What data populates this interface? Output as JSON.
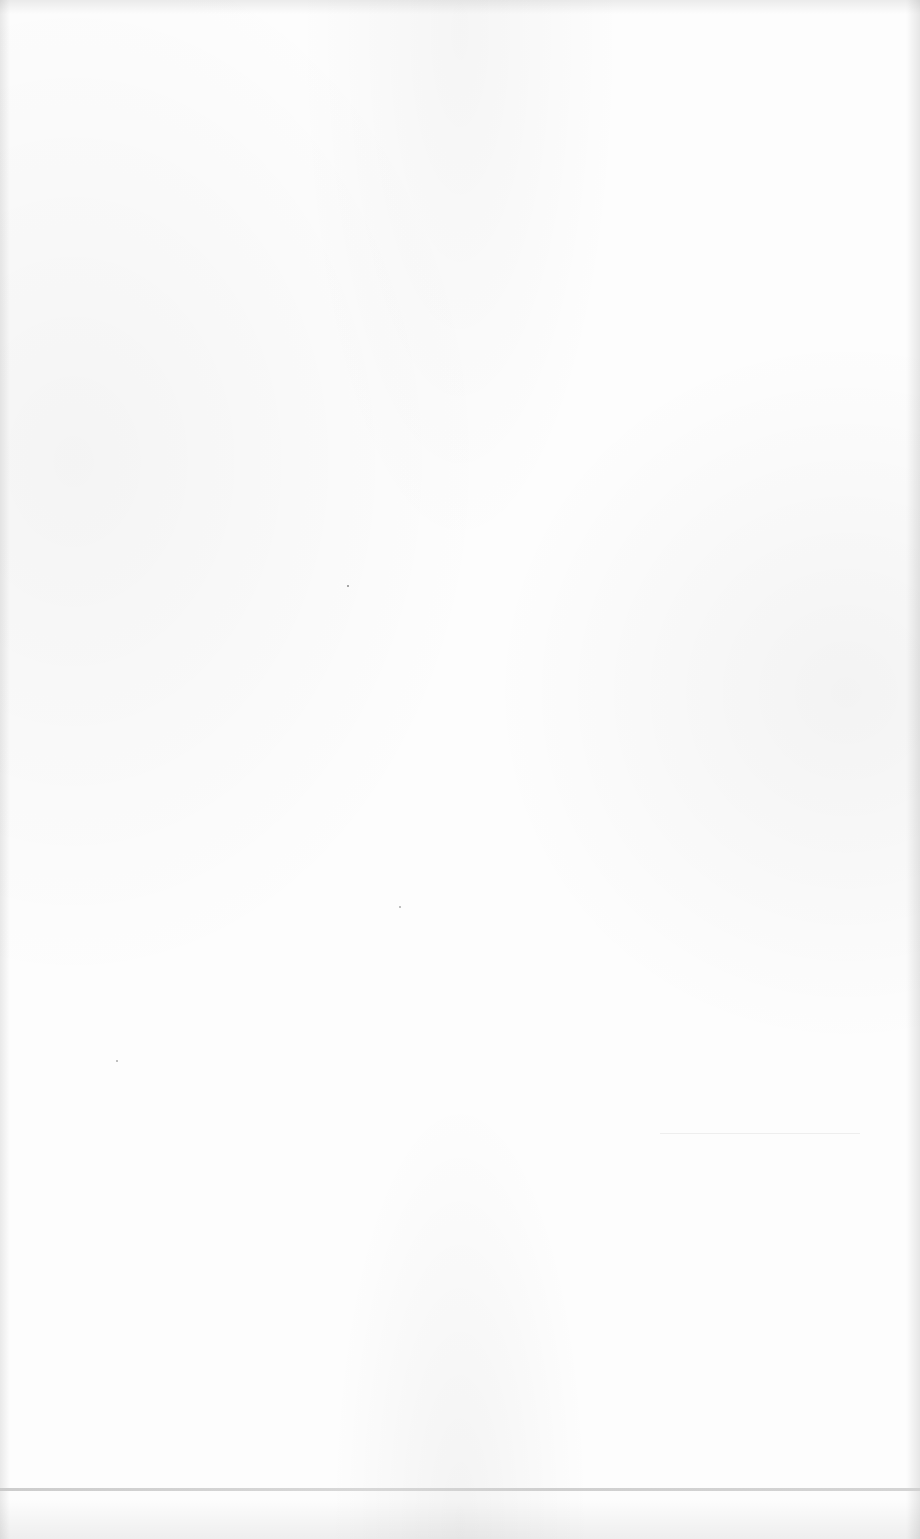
{
  "document": {
    "type": "blank scanned page",
    "text_content": [],
    "elements": {
      "footer_rule": {
        "visible": true
      },
      "specks": 3
    },
    "colors": {
      "paper": "#fdfdfd",
      "rule": "#c8c8c8"
    }
  }
}
